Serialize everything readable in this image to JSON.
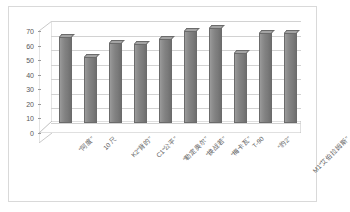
{
  "chart_data": {
    "type": "bar",
    "title": "",
    "subtitle": "",
    "xlabel": "",
    "ylabel": "",
    "ylim": [
      0,
      70
    ],
    "yticks": [
      0,
      10,
      20,
      30,
      40,
      50,
      60,
      70
    ],
    "ytick_labels": [
      "0",
      "10",
      "20",
      "30",
      "40",
      "50",
      "60",
      "70"
    ],
    "grid": true,
    "legend": false,
    "legend_position": "none",
    "style": "3d-column",
    "bar_color": "#808080",
    "categories": [
      "“阿度”",
      "10 尺",
      "K2“背的”",
      "C1“公平”",
      "“勒定奥尔”",
      "“换战若”",
      "“梅卡瓦”",
      "T-90",
      "“豹⁡2”",
      "M1“艾伯拉姆斯”"
    ],
    "values": [
      59,
      45,
      55,
      54,
      58,
      63,
      65,
      48,
      62,
      62
    ],
    "series": [
      {
        "name": "系列1",
        "values": [
          59,
          45,
          55,
          54,
          58,
          63,
          65,
          48,
          62,
          62
        ]
      }
    ]
  },
  "frame": {
    "border_color": "#d9d9d9",
    "background": "#ffffff"
  }
}
